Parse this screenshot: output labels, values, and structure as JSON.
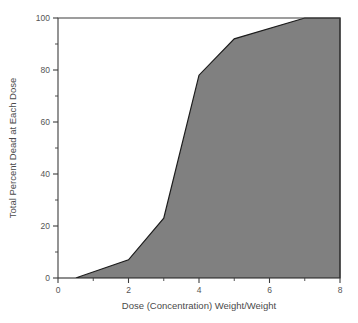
{
  "chart_data": {
    "type": "area",
    "title": "",
    "xlabel": "Dose (Concentration) Weight/Weight",
    "ylabel": "Total Percent Dead at Each Dose",
    "xlim": [
      0,
      8
    ],
    "ylim": [
      0,
      100
    ],
    "grid": false,
    "legend": "none",
    "x_ticks": [
      0,
      2,
      4,
      6,
      8
    ],
    "x_tick_labels": [
      "0",
      "2",
      "4",
      "6",
      "8"
    ],
    "x_minor_ticks": [
      1,
      3,
      5,
      7
    ],
    "y_ticks": [
      0,
      20,
      40,
      60,
      80,
      100
    ],
    "y_tick_labels": [
      "0",
      "20",
      "40",
      "60",
      "80",
      "100"
    ],
    "y_minor_ticks": [
      10,
      30,
      50,
      70,
      90
    ],
    "series": [
      {
        "name": "Total Percent Dead",
        "fill_color": "#808080",
        "line_color": "#1c1c1c",
        "x": [
          0,
          0.5,
          2,
          3,
          4,
          5,
          7,
          8
        ],
        "values": [
          0,
          0,
          7,
          23,
          78,
          92,
          100,
          100
        ]
      }
    ]
  }
}
